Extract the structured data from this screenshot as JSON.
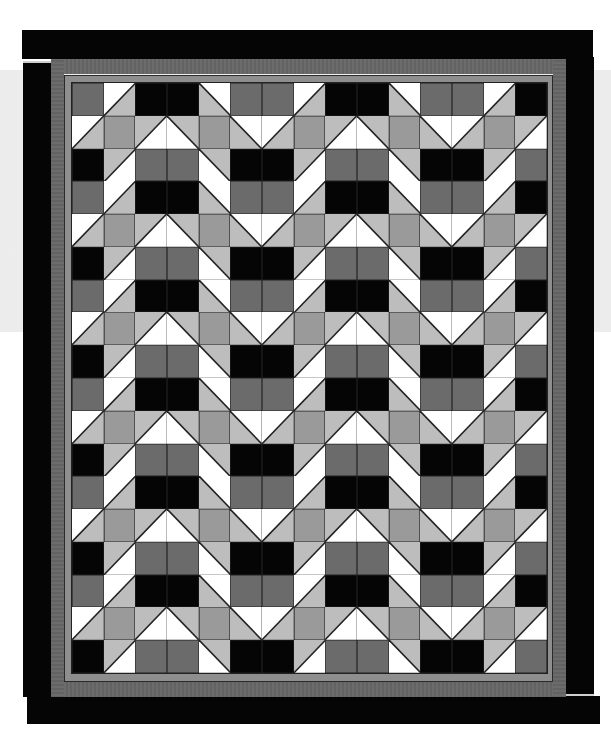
{
  "quilt": {
    "columns": 15,
    "rows": 18,
    "colors": {
      "black": "#050505",
      "dark_gray": "#6b6b6b",
      "mid_gray": "#9a9a9a",
      "light_gray": "#bdbdbd",
      "white": "#ffffff",
      "seam": "#222222",
      "border_dark_gray": "#666666",
      "inner_strip": "#8e8e8e"
    },
    "legend": {
      "K": "black square",
      "D": "dark gray square",
      "M": "mid gray square",
      "S1": "half-square triangle, / diagonal, white top-left, light gray bottom-right",
      "S2": "half-square triangle, / diagonal, light gray top-left, white bottom-right",
      "B1": "half-square triangle, \\ diagonal, white top-right, light gray bottom-left",
      "B2": "half-square triangle, \\ diagonal, light gray top-right, white bottom-left"
    },
    "row_patterns": [
      [
        "D",
        "S1",
        "K",
        "K",
        "B1",
        "D",
        "D",
        "S1",
        "K",
        "K",
        "B1",
        "D",
        "D",
        "S1",
        "K"
      ],
      [
        "S1",
        "M",
        "S2",
        "B2",
        "M",
        "B1",
        "S1",
        "M",
        "S2",
        "B2",
        "M",
        "B1",
        "S1",
        "M",
        "S2"
      ],
      [
        "K",
        "S2",
        "D",
        "D",
        "B2",
        "K",
        "K",
        "S2",
        "D",
        "D",
        "B2",
        "K",
        "K",
        "S2",
        "D"
      ]
    ],
    "row_sequence": [
      0,
      1,
      2,
      0,
      1,
      2,
      0,
      1,
      2,
      0,
      1,
      2,
      0,
      1,
      2,
      0,
      1,
      2
    ],
    "borders": [
      "inner medium-gray strip",
      "dark gray striped border",
      "outer black border"
    ]
  }
}
